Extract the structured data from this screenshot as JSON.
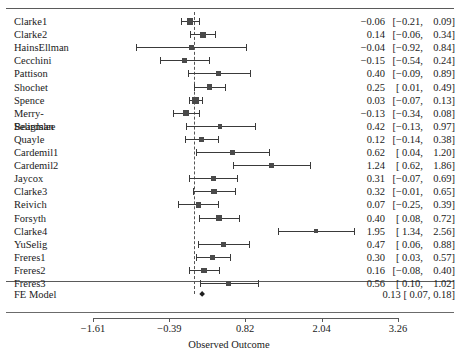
{
  "figure": {
    "clipped_caption": "",
    "axis_title": "Observed Outcome",
    "summary_label": "FE Model"
  },
  "chart_data": {
    "type": "forest",
    "title": "",
    "xlabel": "Observed Outcome",
    "ylabel": "",
    "xlim": [
      -1.61,
      3.26
    ],
    "xticks": [
      -1.61,
      -0.39,
      0.82,
      2.04,
      3.26
    ],
    "xticklabels": [
      "−1.61",
      "−0.39",
      "0.82",
      "2.04",
      "3.26"
    ],
    "reference_line": 0,
    "grid": false,
    "legend": null,
    "studies": [
      {
        "label": "Clarke1",
        "estimate": -0.06,
        "ci_low": -0.21,
        "ci_high": 0.09,
        "text": "−0.06 [−0.21, 0.09]",
        "est_text": "−0.06",
        "lo_text": "[−0.21,",
        "hi_text": "0.09]",
        "weight": 1.0
      },
      {
        "label": "Clarke2",
        "estimate": 0.14,
        "ci_low": -0.06,
        "ci_high": 0.34,
        "text": "0.14 [−0.06, 0.34]",
        "est_text": "0.14",
        "lo_text": "[−0.06,",
        "hi_text": "0.34]",
        "weight": 0.8
      },
      {
        "label": "HainsEllman",
        "estimate": -0.04,
        "ci_low": -0.92,
        "ci_high": 0.84,
        "text": "−0.04 [−0.92, 0.84]",
        "est_text": "−0.04",
        "lo_text": "[−0.92,",
        "hi_text": "0.84]",
        "weight": 0.36
      },
      {
        "label": "Cecchini",
        "estimate": -0.15,
        "ci_low": -0.54,
        "ci_high": 0.24,
        "text": "−0.15 [−0.54, 0.24]",
        "est_text": "−0.15",
        "lo_text": "[−0.54,",
        "hi_text": "0.24]",
        "weight": 0.55
      },
      {
        "label": "Pattison",
        "estimate": 0.4,
        "ci_low": -0.09,
        "ci_high": 0.89,
        "text": "0.40 [−0.09, 0.89]",
        "est_text": "0.40",
        "lo_text": "[−0.09,",
        "hi_text": "0.89]",
        "weight": 0.47
      },
      {
        "label": "Shochet",
        "estimate": 0.25,
        "ci_low": 0.01,
        "ci_high": 0.49,
        "text": "0.25 [  0.01, 0.49]",
        "est_text": "0.25",
        "lo_text": "[  0.01,",
        "hi_text": "0.49]",
        "weight": 0.72
      },
      {
        "label": "Spence",
        "estimate": 0.03,
        "ci_low": -0.07,
        "ci_high": 0.13,
        "text": "0.03 [−0.07, 0.13]",
        "est_text": "0.03",
        "lo_text": "[−0.07,",
        "hi_text": "0.13]",
        "weight": 1.15
      },
      {
        "label": "Merry-",
        "label2": "Beardslee",
        "estimate": -0.13,
        "ci_low": -0.34,
        "ci_high": 0.08,
        "text": "−0.13 [−0.34, 0.08]",
        "est_text": "−0.13",
        "lo_text": "[−0.34,",
        "hi_text": "0.08]",
        "weight": 0.78
      },
      {
        "label": "Seligman",
        "estimate": 0.42,
        "ci_low": -0.13,
        "ci_high": 0.97,
        "text": "0.42 [−0.13, 0.97]",
        "est_text": "0.42",
        "lo_text": "[−0.13,",
        "hi_text": "0.97]",
        "weight": 0.44
      },
      {
        "label": "Quayle",
        "estimate": 0.12,
        "ci_low": -0.14,
        "ci_high": 0.38,
        "text": "0.12 [−0.14, 0.38]",
        "est_text": "0.12",
        "lo_text": "[−0.14,",
        "hi_text": "0.38]",
        "weight": 0.7
      },
      {
        "label": "Cardemil1",
        "estimate": 0.62,
        "ci_low": 0.04,
        "ci_high": 1.2,
        "text": "0.62 [  0.04, 1.20]",
        "est_text": "0.62",
        "lo_text": "[  0.04,",
        "hi_text": "1.20]",
        "weight": 0.42
      },
      {
        "label": "Cardemil2",
        "estimate": 1.24,
        "ci_low": 0.62,
        "ci_high": 1.86,
        "text": "1.24 [  0.62, 1.86]",
        "est_text": "1.24",
        "lo_text": "[  0.62,",
        "hi_text": "1.86]",
        "weight": 0.4
      },
      {
        "label": "Jaycox",
        "estimate": 0.31,
        "ci_low": -0.07,
        "ci_high": 0.69,
        "text": "0.31 [−0.07, 0.69]",
        "est_text": "0.31",
        "lo_text": "[−0.07,",
        "hi_text": "0.69]",
        "weight": 0.56
      },
      {
        "label": "Clarke3",
        "estimate": 0.32,
        "ci_low": -0.01,
        "ci_high": 0.65,
        "text": "0.32 [−0.01, 0.65]",
        "est_text": "0.32",
        "lo_text": "[−0.01,",
        "hi_text": "0.65]",
        "weight": 0.61
      },
      {
        "label": "Reivich",
        "estimate": 0.07,
        "ci_low": -0.25,
        "ci_high": 0.39,
        "text": "0.07 [−0.25, 0.39]",
        "est_text": "0.07",
        "lo_text": "[−0.25,",
        "hi_text": "0.39]",
        "weight": 0.62
      },
      {
        "label": "Forsyth",
        "estimate": 0.4,
        "ci_low": 0.08,
        "ci_high": 0.72,
        "text": "0.40 [  0.08, 0.72]",
        "est_text": "0.40",
        "lo_text": "[  0.08,",
        "hi_text": "0.72]",
        "weight": 0.62
      },
      {
        "label": "Clarke4",
        "estimate": 1.95,
        "ci_low": 1.34,
        "ci_high": 2.56,
        "text": "1.95 [  1.34, 2.56]",
        "est_text": "1.95",
        "lo_text": "[  1.34,",
        "hi_text": "2.56]",
        "weight": 0.41
      },
      {
        "label": "YuSelig",
        "estimate": 0.47,
        "ci_low": 0.06,
        "ci_high": 0.88,
        "text": "0.47 [  0.06, 0.88]",
        "est_text": "0.47",
        "lo_text": "[  0.06,",
        "hi_text": "0.88]",
        "weight": 0.54
      },
      {
        "label": "Freres1",
        "estimate": 0.3,
        "ci_low": 0.03,
        "ci_high": 0.57,
        "text": "0.30 [  0.03, 0.57]",
        "est_text": "0.30",
        "lo_text": "[  0.03,",
        "hi_text": "0.57]",
        "weight": 0.68
      },
      {
        "label": "Freres2",
        "estimate": 0.16,
        "ci_low": -0.08,
        "ci_high": 0.4,
        "text": "0.16 [−0.08, 0.40]",
        "est_text": "0.16",
        "lo_text": "[−0.08,",
        "hi_text": "0.40]",
        "weight": 0.72
      },
      {
        "label": "Freres3",
        "estimate": 0.56,
        "ci_low": 0.1,
        "ci_high": 1.02,
        "text": "0.56 [  0.10, 1.02]",
        "est_text": "0.56",
        "lo_text": "[  0.10,",
        "hi_text": "1.02]",
        "weight": 0.5
      }
    ],
    "summary": {
      "label": "FE Model",
      "estimate": 0.13,
      "ci_low": 0.07,
      "ci_high": 0.18,
      "text": "0.13 [  0.07, 0.18]",
      "est_text": "0.13",
      "lo_text": "[  0.07,",
      "hi_text": "0.18]"
    }
  }
}
